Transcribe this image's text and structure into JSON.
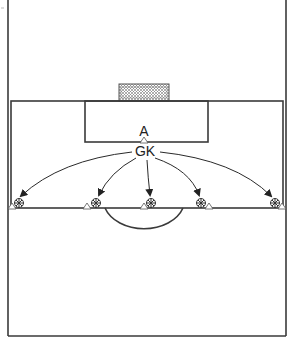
{
  "diagram": {
    "title": "",
    "labels": {
      "attacker": "A",
      "goalkeeper": "GK"
    },
    "colors": {
      "line": "#3a3a3a",
      "background": "#ffffff",
      "net": "#888888"
    },
    "players": [
      {
        "role": "ball",
        "x": 19,
        "y": 204
      },
      {
        "role": "ball",
        "x": 96,
        "y": 204
      },
      {
        "role": "ball",
        "x": 150,
        "y": 204
      },
      {
        "role": "ball",
        "x": 201,
        "y": 204
      },
      {
        "role": "ball",
        "x": 274,
        "y": 204
      }
    ],
    "cones": [
      {
        "x": 12,
        "y": 208
      },
      {
        "x": 87,
        "y": 208
      },
      {
        "x": 144,
        "y": 208
      },
      {
        "x": 209,
        "y": 208
      },
      {
        "x": 282,
        "y": 208
      }
    ]
  }
}
